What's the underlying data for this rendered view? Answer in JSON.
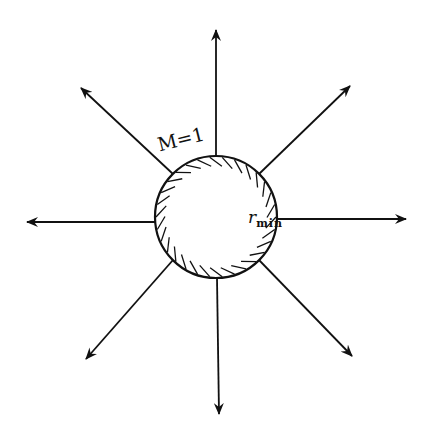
{
  "diagram": {
    "labels": {
      "mach": "M=1",
      "radius_symbol": "r",
      "radius_subscript": "min"
    },
    "sphere": {
      "cx": 216,
      "cy": 217,
      "r": 61
    },
    "arrows": [
      {
        "name": "up",
        "x1": 216,
        "y1": 156,
        "x2": 216,
        "y2": 30
      },
      {
        "name": "upper-right",
        "x1": 259,
        "y1": 174,
        "x2": 350,
        "y2": 86
      },
      {
        "name": "right",
        "x1": 277,
        "y1": 219,
        "x2": 406,
        "y2": 219
      },
      {
        "name": "lower-right",
        "x1": 259,
        "y1": 260,
        "x2": 352,
        "y2": 356
      },
      {
        "name": "down",
        "x1": 217,
        "y1": 278,
        "x2": 219,
        "y2": 414
      },
      {
        "name": "lower-left",
        "x1": 173,
        "y1": 260,
        "x2": 86,
        "y2": 359
      },
      {
        "name": "left",
        "x1": 155,
        "y1": 222,
        "x2": 27,
        "y2": 222
      },
      {
        "name": "upper-left",
        "x1": 173,
        "y1": 174,
        "x2": 81,
        "y2": 88
      }
    ],
    "colors": {
      "ink": "#111111",
      "background": "#ffffff"
    }
  }
}
